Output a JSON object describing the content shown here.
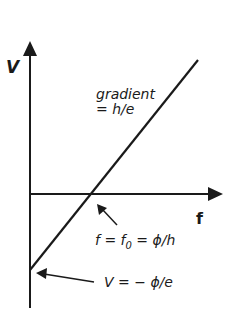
{
  "diagram": {
    "type": "graph",
    "y_axis_label": "V",
    "x_axis_label": "f",
    "line_annotation": {
      "line1": "gradient",
      "line2": "= h/e"
    },
    "x_intercept_annotation": {
      "prefix": "f = f",
      "subscript": "0",
      "suffix": " = ϕ/h"
    },
    "y_intercept_annotation": "V = − ϕ/e",
    "colors": {
      "ink": "#1a1a1a",
      "background": "#ffffff"
    }
  }
}
